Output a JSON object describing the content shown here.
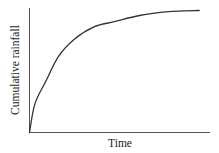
{
  "chart_data": {
    "type": "line",
    "title": "",
    "xlabel": "Time",
    "ylabel": "Cumulative rainfall",
    "xticks": [],
    "yticks": [],
    "grid": false,
    "legend": null,
    "xlim": [
      0,
      1
    ],
    "ylim": [
      0,
      1
    ],
    "series": [
      {
        "name": "Cumulative rainfall",
        "x": [
          0.0,
          0.03,
          0.09,
          0.16,
          0.25,
          0.36,
          0.47,
          0.61,
          0.77,
          0.94
        ],
        "y": [
          0.0,
          0.23,
          0.41,
          0.61,
          0.75,
          0.85,
          0.89,
          0.94,
          0.97,
          0.98
        ]
      }
    ]
  },
  "style": {
    "axis_color": "#555555",
    "curve_color": "#333333",
    "background": "#ffffff"
  }
}
